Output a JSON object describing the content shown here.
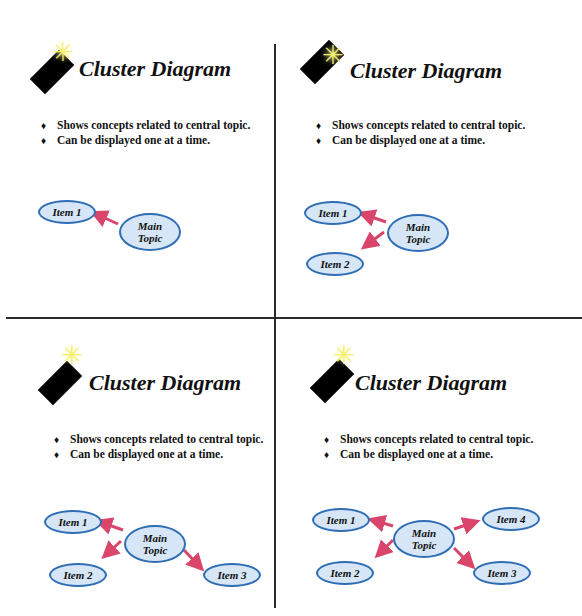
{
  "slides": [
    {
      "title": "Cluster Diagram",
      "bullets": [
        "Shows concepts related to central topic.",
        "Can be displayed one at a time."
      ],
      "main_topic": "Main\nTopic",
      "items": [
        "Item 1"
      ]
    },
    {
      "title": "Cluster Diagram",
      "bullets": [
        "Shows concepts related to central topic.",
        "Can be displayed one at a time."
      ],
      "main_topic": "Main\nTopic",
      "items": [
        "Item 1",
        "Item 2"
      ]
    },
    {
      "title": "Cluster Diagram",
      "bullets": [
        "Shows concepts related to central topic.",
        "Can be displayed one at a time."
      ],
      "main_topic": "Main\nTopic",
      "items": [
        "Item 1",
        "Item 2",
        "Item 3"
      ]
    },
    {
      "title": "Cluster Diagram",
      "bullets": [
        "Shows concepts related to central topic.",
        "Can be displayed one at a time."
      ],
      "main_topic": "Main\nTopic",
      "items": [
        "Item 1",
        "Item 2",
        "Item 3",
        "Item 4"
      ]
    }
  ],
  "bullet_glyph": "♦",
  "star_glyph": "✳",
  "colors": {
    "node_fill": "#d6e6f7",
    "node_border": "#2f6db5",
    "arrow": "#d9456b",
    "star": "#f5f06a"
  }
}
